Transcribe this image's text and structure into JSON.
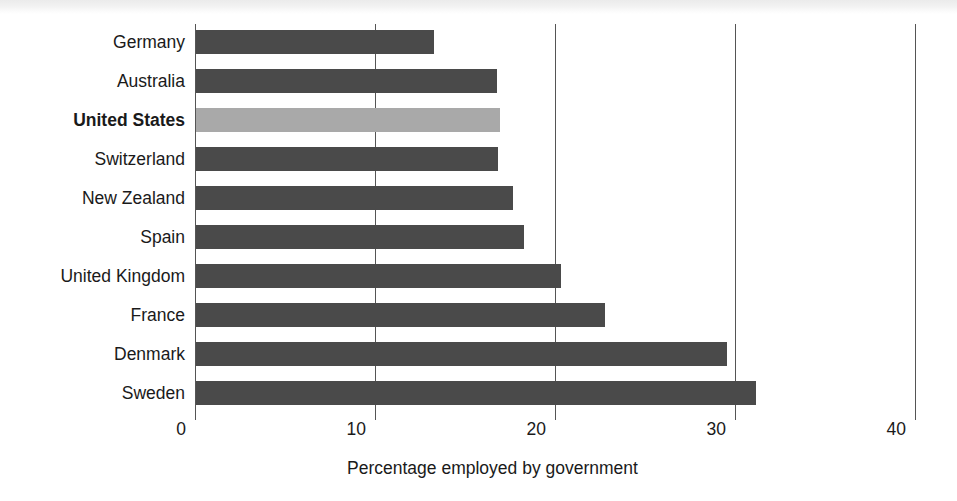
{
  "chart_data": {
    "type": "bar",
    "orientation": "horizontal",
    "title": "",
    "xlabel": "Percentage employed by government",
    "ylabel": "",
    "xlim": [
      0,
      40
    ],
    "xticks": [
      0,
      10,
      20,
      30,
      40
    ],
    "xtick_labels": [
      "0",
      "10",
      "20",
      "30",
      "40"
    ],
    "grid": "vertical",
    "legend": "none",
    "categories": [
      "Germany",
      "Australia",
      "United States",
      "Switzerland",
      "New Zealand",
      "Spain",
      "United Kingdom",
      "France",
      "Denmark",
      "Sweden"
    ],
    "values": [
      13.2,
      16.7,
      16.9,
      16.8,
      17.6,
      18.2,
      20.3,
      22.7,
      29.5,
      31.1
    ],
    "highlight_category": "United States",
    "colors": {
      "bar": "#4a4a4a",
      "bar_highlight": "#a9a9a9",
      "gridline": "#555555",
      "text": "#1a1a1a",
      "background": "#ffffff"
    }
  }
}
